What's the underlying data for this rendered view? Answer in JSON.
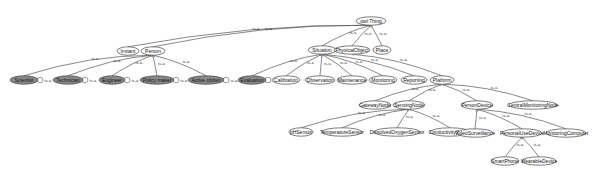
{
  "diagram": {
    "edge_label": "is-a",
    "nodes": [
      {
        "id": "owlThing",
        "label": "owl:Thing",
        "x": 371,
        "y": 21,
        "w": 30,
        "style": "white"
      },
      {
        "id": "Instant",
        "label": "Instant",
        "x": 128,
        "y": 51,
        "w": 22,
        "style": "white"
      },
      {
        "id": "Person",
        "label": "Person",
        "x": 153,
        "y": 51,
        "w": 24,
        "style": "white"
      },
      {
        "id": "Situation",
        "label": "Situation",
        "x": 322,
        "y": 50,
        "w": 28,
        "style": "white"
      },
      {
        "id": "PhysicalObject",
        "label": "PhysicalObject",
        "x": 352,
        "y": 50,
        "w": 36,
        "style": "white"
      },
      {
        "id": "Place",
        "label": "Place",
        "x": 382,
        "y": 50,
        "w": 18,
        "style": "white"
      },
      {
        "id": "Scientist",
        "label": "Scientist",
        "x": 24,
        "y": 80,
        "w": 28,
        "style": "gray"
      },
      {
        "id": "Technician",
        "label": "Technician",
        "x": 68,
        "y": 80,
        "w": 30,
        "style": "gray"
      },
      {
        "id": "Engineer",
        "label": "Engineer",
        "x": 112,
        "y": 80,
        "w": 26,
        "style": "gray"
      },
      {
        "id": "PolicyMaker",
        "label": "Policy maker",
        "x": 157,
        "y": 80,
        "w": 34,
        "style": "gray"
      },
      {
        "id": "ActiveCitizen",
        "label": "Active citizen",
        "x": 206,
        "y": 80,
        "w": 36,
        "style": "gray"
      },
      {
        "id": "Evaluation",
        "label": "Evaluation",
        "x": 252,
        "y": 80,
        "w": 28,
        "style": "gray"
      },
      {
        "id": "Calibration",
        "label": "Calibration",
        "x": 286,
        "y": 80,
        "w": 28,
        "style": "white"
      },
      {
        "id": "Observation",
        "label": "Observation",
        "x": 320,
        "y": 80,
        "w": 30,
        "style": "white"
      },
      {
        "id": "Maintenance",
        "label": "Maintenance",
        "x": 352,
        "y": 80,
        "w": 30,
        "style": "white"
      },
      {
        "id": "Monitoring",
        "label": "Monitoring",
        "x": 383,
        "y": 80,
        "w": 28,
        "style": "white"
      },
      {
        "id": "Reporting",
        "label": "Reporting",
        "x": 414,
        "y": 80,
        "w": 26,
        "style": "white"
      },
      {
        "id": "Platform",
        "label": "Platform",
        "x": 442,
        "y": 80,
        "w": 24,
        "style": "white"
      },
      {
        "id": "GatewayNode",
        "label": "GatewayNode",
        "x": 375,
        "y": 105,
        "w": 32,
        "style": "white"
      },
      {
        "id": "SensingNode",
        "label": "SensingNode",
        "x": 409,
        "y": 105,
        "w": 32,
        "style": "white"
      },
      {
        "id": "PersonDevice",
        "label": "PersonDevice",
        "x": 477,
        "y": 105,
        "w": 32,
        "style": "white"
      },
      {
        "id": "CentralMonitoringNode",
        "label": "CentralMonitoringNode",
        "x": 533,
        "y": 105,
        "w": 48,
        "style": "white"
      },
      {
        "id": "pHSensor",
        "label": "pHSensor",
        "x": 301,
        "y": 132,
        "w": 24,
        "style": "white"
      },
      {
        "id": "TemperatureSensor",
        "label": "TemperatureSensor",
        "x": 342,
        "y": 132,
        "w": 40,
        "style": "white"
      },
      {
        "id": "DissolvedOxygenSensor",
        "label": "DissolvedOxygenSensor",
        "x": 397,
        "y": 132,
        "w": 46,
        "style": "white"
      },
      {
        "id": "ConductivitySensor",
        "label": "ConductivitySensor",
        "x": 450,
        "y": 132,
        "w": 40,
        "style": "white"
      },
      {
        "id": "VideoSurveillance",
        "label": "VideoSurveillance",
        "x": 475,
        "y": 133,
        "w": 36,
        "style": "white"
      },
      {
        "id": "PersonalUseDevice",
        "label": "PersonalUseDevice",
        "x": 522,
        "y": 133,
        "w": 40,
        "style": "white"
      },
      {
        "id": "MonitoringComputer",
        "label": "MonitoringComputer",
        "x": 566,
        "y": 133,
        "w": 40,
        "style": "white"
      },
      {
        "id": "SmartPhone",
        "label": "SmartPhone",
        "x": 505,
        "y": 161,
        "w": 28,
        "style": "white"
      },
      {
        "id": "WearableDevice",
        "label": "WearableDevice",
        "x": 539,
        "y": 161,
        "w": 34,
        "style": "white"
      }
    ],
    "edges": [
      {
        "from": "Instant",
        "to": "owlThing"
      },
      {
        "from": "Person",
        "to": "owlThing"
      },
      {
        "from": "Situation",
        "to": "owlThing"
      },
      {
        "from": "PhysicalObject",
        "to": "owlThing"
      },
      {
        "from": "Place",
        "to": "owlThing"
      },
      {
        "from": "Scientist",
        "to": "Person"
      },
      {
        "from": "Technician",
        "to": "Person"
      },
      {
        "from": "Engineer",
        "to": "Person"
      },
      {
        "from": "PolicyMaker",
        "to": "Person"
      },
      {
        "from": "ActiveCitizen",
        "to": "Person"
      },
      {
        "from": "Evaluation",
        "to": "Situation"
      },
      {
        "from": "Calibration",
        "to": "Situation"
      },
      {
        "from": "Observation",
        "to": "Situation"
      },
      {
        "from": "Maintenance",
        "to": "Situation"
      },
      {
        "from": "Monitoring",
        "to": "Situation"
      },
      {
        "from": "Reporting",
        "to": "Situation"
      },
      {
        "from": "Platform",
        "to": "PhysicalObject"
      },
      {
        "from": "GatewayNode",
        "to": "Platform"
      },
      {
        "from": "SensingNode",
        "to": "Platform"
      },
      {
        "from": "PersonDevice",
        "to": "Platform"
      },
      {
        "from": "CentralMonitoringNode",
        "to": "Platform"
      },
      {
        "from": "pHSensor",
        "to": "SensingNode"
      },
      {
        "from": "TemperatureSensor",
        "to": "SensingNode"
      },
      {
        "from": "DissolvedOxygenSensor",
        "to": "SensingNode"
      },
      {
        "from": "ConductivitySensor",
        "to": "SensingNode"
      },
      {
        "from": "VideoSurveillance",
        "to": "PersonDevice"
      },
      {
        "from": "PersonalUseDevice",
        "to": "PersonDevice"
      },
      {
        "from": "MonitoringComputer",
        "to": "PersonDevice"
      },
      {
        "from": "SmartPhone",
        "to": "PersonalUseDevice"
      },
      {
        "from": "WearableDevice",
        "to": "PersonalUseDevice"
      }
    ],
    "self_loops": [
      "Scientist",
      "Technician",
      "Engineer",
      "PolicyMaker",
      "ActiveCitizen",
      "Evaluation"
    ]
  }
}
